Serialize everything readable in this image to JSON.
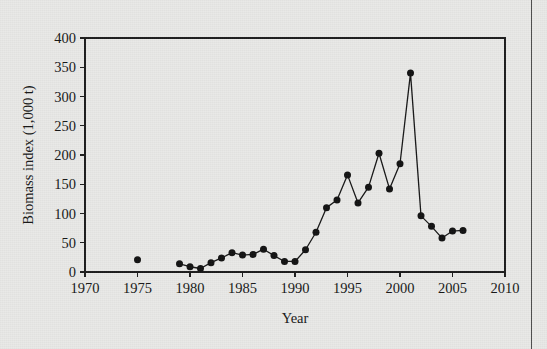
{
  "chart_data": {
    "type": "line",
    "title": "",
    "subtitle": "",
    "xlabel": "Year",
    "ylabel": "Biomass index (1,000 t)",
    "xlim": [
      1970,
      2010
    ],
    "ylim": [
      0,
      400
    ],
    "xticks": [
      1970,
      1975,
      1980,
      1985,
      1990,
      1995,
      2000,
      2005,
      2010
    ],
    "xticklabels": [
      "1970",
      "1975",
      "1980",
      "1985",
      "1990",
      "1995",
      "2000",
      "2005",
      "2010"
    ],
    "yticks": [
      0,
      50,
      100,
      150,
      200,
      250,
      300,
      350,
      400
    ],
    "yticklabels": [
      "0",
      "50",
      "100",
      "150",
      "200",
      "250",
      "300",
      "350",
      "400"
    ],
    "grid": false,
    "legend": null,
    "marker": "filled-circle",
    "line_color": "#161616",
    "marker_color": "#111111",
    "background_color": "#e9e9e7",
    "series": [
      {
        "name": "Biomass index",
        "connected_from": 1979,
        "points": [
          {
            "x": 1975,
            "y": 21
          },
          {
            "x": 1979,
            "y": 14
          },
          {
            "x": 1980,
            "y": 9
          },
          {
            "x": 1981,
            "y": 6
          },
          {
            "x": 1982,
            "y": 16
          },
          {
            "x": 1983,
            "y": 24
          },
          {
            "x": 1984,
            "y": 33
          },
          {
            "x": 1985,
            "y": 29
          },
          {
            "x": 1986,
            "y": 30
          },
          {
            "x": 1987,
            "y": 39
          },
          {
            "x": 1988,
            "y": 28
          },
          {
            "x": 1989,
            "y": 18
          },
          {
            "x": 1990,
            "y": 18
          },
          {
            "x": 1991,
            "y": 38
          },
          {
            "x": 1992,
            "y": 68
          },
          {
            "x": 1993,
            "y": 110
          },
          {
            "x": 1994,
            "y": 123
          },
          {
            "x": 1995,
            "y": 166
          },
          {
            "x": 1996,
            "y": 118
          },
          {
            "x": 1997,
            "y": 145
          },
          {
            "x": 1998,
            "y": 203
          },
          {
            "x": 1999,
            "y": 142
          },
          {
            "x": 2000,
            "y": 185
          },
          {
            "x": 2001,
            "y": 340
          },
          {
            "x": 2002,
            "y": 96
          },
          {
            "x": 2003,
            "y": 78
          },
          {
            "x": 2004,
            "y": 58
          },
          {
            "x": 2005,
            "y": 70
          },
          {
            "x": 2006,
            "y": 71
          }
        ]
      }
    ]
  },
  "figure": {
    "caption": ""
  }
}
